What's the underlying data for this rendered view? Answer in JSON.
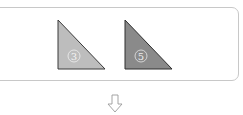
{
  "diagram": {
    "shapes": [
      {
        "label": "③",
        "fill": "#bdbdbd",
        "stroke": "#3a3a3a"
      },
      {
        "label": "⑤",
        "fill": "#8a8a8a",
        "stroke": "#2e2e2e"
      }
    ],
    "arrow": {
      "direction": "down",
      "icon": "outline-down-arrow"
    }
  }
}
